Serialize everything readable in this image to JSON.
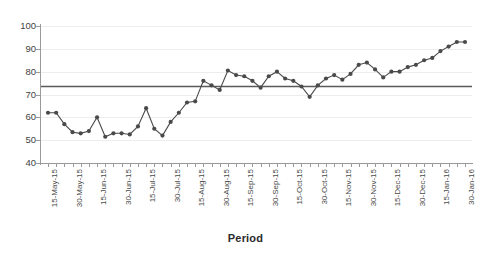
{
  "chart_data": {
    "type": "line",
    "title": "",
    "subtitle": "",
    "xlabel": "Period",
    "ylabel": "",
    "ylim": [
      40,
      100
    ],
    "yticks": [
      40,
      50,
      60,
      70,
      80,
      90,
      100
    ],
    "grid": true,
    "legend": false,
    "legend_position": "none",
    "series_color": "#4a4a4a",
    "marker": "circle",
    "reference_line": {
      "name": "center-line",
      "value": 73.5,
      "orientation": "horizontal",
      "color": "#5a5a5a"
    },
    "x_tick_labels": [
      "15-May-15",
      "30-May-15",
      "15-Jun-15",
      "30-Jun-15",
      "15-Jul-15",
      "30-Jul-15",
      "15-Aug-15",
      "30-Aug-15",
      "15-Sep-15",
      "30-Sep-15",
      "15-Oct-15",
      "30-Oct-15",
      "15-Nov-15",
      "30-Nov-15",
      "15-Dec-15",
      "30-Dec-15",
      "15-Jan-16",
      "30-Jan-16"
    ],
    "x_label_every_n_ticks": 3,
    "n_points": 52,
    "values": [
      62,
      62,
      57,
      53.5,
      53,
      54,
      60,
      51.5,
      53,
      53,
      52.5,
      56,
      64,
      55,
      52,
      58,
      62,
      66.5,
      67,
      76,
      74,
      72,
      80.5,
      78.5,
      78,
      76,
      73,
      78,
      80,
      77,
      76,
      73.5,
      69,
      74,
      77,
      78.5,
      76.5,
      79,
      83,
      84,
      81,
      77.5,
      80,
      80,
      82,
      83,
      85,
      86,
      89,
      91,
      93,
      93
    ],
    "series": [
      {
        "name": "Period value",
        "color": "#4a4a4a",
        "values": [
          62,
          62,
          57,
          53.5,
          53,
          54,
          60,
          51.5,
          53,
          53,
          52.5,
          56,
          64,
          55,
          52,
          58,
          62,
          66.5,
          67,
          76,
          74,
          72,
          80.5,
          78.5,
          78,
          76,
          73,
          78,
          80,
          77,
          76,
          73.5,
          69,
          74,
          77,
          78.5,
          76.5,
          79,
          83,
          84,
          81,
          77.5,
          80,
          80,
          82,
          83,
          85,
          86,
          89,
          91,
          93,
          93
        ]
      }
    ]
  }
}
